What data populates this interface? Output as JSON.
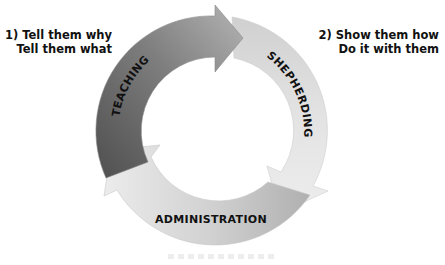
{
  "notes": {
    "left": {
      "line1": "1) Tell them why",
      "line2": "Tell them what"
    },
    "right": {
      "line1": "2) Show them how",
      "line2": "Do it with them"
    }
  },
  "cycle": {
    "segments": [
      {
        "label": "TEACHING",
        "color_start": "#5a5a5a",
        "color_end": "#a8a8a8"
      },
      {
        "label": "SHEPHERDING",
        "color_start": "#d4d4d4",
        "color_end": "#ececec"
      },
      {
        "label": "ADMINISTRATION",
        "color_start": "#e4e4e4",
        "color_end": "#bdbdbd"
      }
    ]
  }
}
